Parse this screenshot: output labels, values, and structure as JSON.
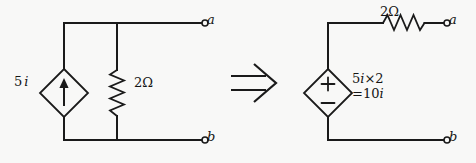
{
  "figure": {
    "background_color": "#f8f8f7",
    "ink_color": "#1a1a1a"
  },
  "transform_arrow": {
    "symbol": "⟹",
    "name": "implies-arrow"
  },
  "left_circuit": {
    "name": "norton-equivalent",
    "source": {
      "type": "dependent-current-source",
      "shape": "diamond",
      "arrow_direction": "up",
      "label_value": "5",
      "label_variable": "i",
      "label_full": "5 i"
    },
    "resistor": {
      "type": "resistor",
      "orientation": "vertical",
      "label": "2Ω",
      "value": "2",
      "unit": "Ω"
    },
    "terminals": [
      {
        "id": "a",
        "label": "a",
        "position": "top-right"
      },
      {
        "id": "b",
        "label": "b",
        "position": "bottom-right"
      }
    ]
  },
  "right_circuit": {
    "name": "thevenin-equivalent",
    "source": {
      "type": "dependent-voltage-source",
      "shape": "diamond",
      "polarity_top": "+",
      "polarity_bottom": "−",
      "label_line1": "5i×2",
      "label_line2": "=10i",
      "label_line1_value": "5",
      "label_line1_var": "i",
      "label_line1_mult": "×2",
      "label_line2_eq": "=10",
      "label_line2_var": "i"
    },
    "resistor": {
      "type": "resistor",
      "orientation": "horizontal",
      "label": "2Ω",
      "value": "2",
      "unit": "Ω"
    },
    "terminals": [
      {
        "id": "a",
        "label": "a",
        "position": "top-right"
      },
      {
        "id": "b",
        "label": "b",
        "position": "bottom-right"
      }
    ]
  }
}
